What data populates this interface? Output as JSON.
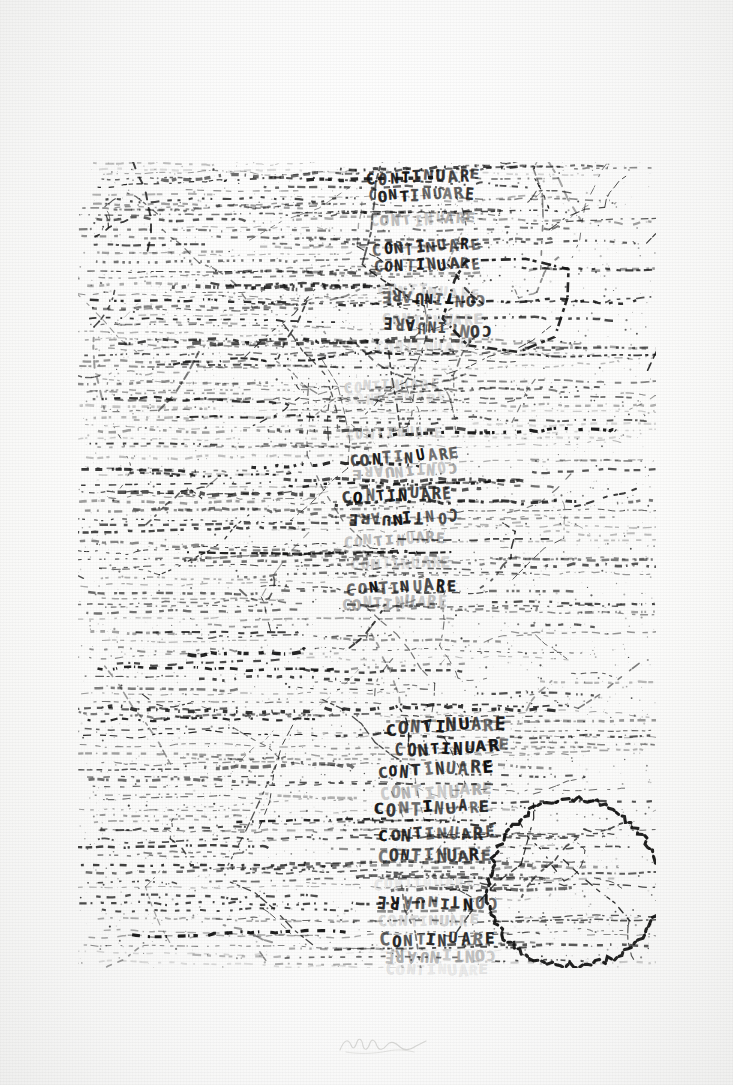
{
  "artwork": {
    "title": "CONTINUARE",
    "medium_appearance": "stamped ink print on paper, scanned",
    "paper_color": "#fdfdfd",
    "ink_color": "#101010",
    "stamped_word": "CONTINUARE",
    "plate": {
      "left": 78,
      "top": 162,
      "width": 578,
      "height": 806
    }
  },
  "text_blocks": [
    {
      "name": "upper-block",
      "rows": [
        {
          "text": "CONTINUARE",
          "x": 288,
          "y": 8,
          "size": 15,
          "rot": -2,
          "opacity": "solid",
          "flip": false,
          "scalex": 1.0
        },
        {
          "text": "CONTINUARE",
          "x": 290,
          "y": 26,
          "size": 15,
          "rot": -1,
          "opacity": "solid",
          "flip": false,
          "scalex": 1.0
        },
        {
          "text": "CONTINUARE",
          "x": 292,
          "y": 50,
          "size": 14,
          "rot": -3,
          "opacity": "faint",
          "flip": false,
          "scalex": 1.0
        },
        {
          "text": "CONTINUARE",
          "x": 294,
          "y": 78,
          "size": 15,
          "rot": -4,
          "opacity": "solid",
          "flip": false,
          "scalex": 1.0
        },
        {
          "text": "CONTINUARE",
          "x": 296,
          "y": 96,
          "size": 15,
          "rot": -2,
          "opacity": "solid",
          "flip": false,
          "scalex": 1.0
        },
        {
          "text": "CONTINUARE",
          "x": 300,
          "y": 122,
          "size": 14,
          "rot": 2,
          "opacity": "vfaint",
          "flip": false,
          "scalex": 1.0
        },
        {
          "text": "CONTINUARE",
          "x": 302,
          "y": 128,
          "size": 15,
          "rot": 3,
          "opacity": "solid",
          "flip": true,
          "scalex": 1.0
        },
        {
          "text": "CONTINUARE",
          "x": 304,
          "y": 150,
          "size": 14,
          "rot": -1,
          "opacity": "vfaint",
          "flip": false,
          "scalex": 1.0
        },
        {
          "text": "CONTINUARE",
          "x": 302,
          "y": 158,
          "size": 15,
          "rot": 4,
          "opacity": "solid",
          "flip": true,
          "scalex": 1.0
        },
        {
          "text": "CONTINUARE",
          "x": 298,
          "y": 178,
          "size": 13,
          "rot": -2,
          "opacity": "vvfaint",
          "flip": false,
          "scalex": 1.0
        }
      ]
    },
    {
      "name": "middle-block",
      "rows": [
        {
          "text": "CONTINUARE",
          "x": 266,
          "y": 216,
          "size": 13,
          "rot": -3,
          "opacity": "vfaint",
          "flip": false,
          "scalex": 1.0
        },
        {
          "text": "CONTINUARE",
          "x": 268,
          "y": 230,
          "size": 13,
          "rot": -2,
          "opacity": "vvfaint",
          "flip": false,
          "scalex": 1.0
        },
        {
          "text": "CONTINUARE",
          "x": 268,
          "y": 264,
          "size": 13,
          "rot": -2,
          "opacity": "vfaint",
          "flip": false,
          "scalex": 1.0
        },
        {
          "text": "CONTINUARE",
          "x": 272,
          "y": 288,
          "size": 15,
          "rot": -5,
          "opacity": "solid",
          "flip": false,
          "scalex": 1.0
        },
        {
          "text": "CONTINUARE",
          "x": 274,
          "y": 302,
          "size": 14,
          "rot": -3,
          "opacity": "faint",
          "flip": true,
          "scalex": 1.0
        },
        {
          "text": "CONTINUARE",
          "x": 264,
          "y": 326,
          "size": 15,
          "rot": -3,
          "opacity": "solid",
          "flip": false,
          "scalex": 1.0
        },
        {
          "text": "CONTINUARE",
          "x": 268,
          "y": 348,
          "size": 15,
          "rot": -2,
          "opacity": "solid",
          "flip": true,
          "scalex": 1.0
        },
        {
          "text": "CONTINUARE",
          "x": 266,
          "y": 370,
          "size": 14,
          "rot": -3,
          "opacity": "faint",
          "flip": false,
          "scalex": 1.0
        },
        {
          "text": "CONTINUARE",
          "x": 272,
          "y": 394,
          "size": 14,
          "rot": -3,
          "opacity": "vfaint",
          "flip": false,
          "scalex": 1.0
        },
        {
          "text": "CONTINUARE",
          "x": 268,
          "y": 418,
          "size": 15,
          "rot": -2,
          "opacity": "solid",
          "flip": false,
          "scalex": 1.0
        },
        {
          "text": "CONTINUARE",
          "x": 264,
          "y": 434,
          "size": 15,
          "rot": -1,
          "opacity": "faint",
          "flip": false,
          "scalex": 1.0
        }
      ]
    },
    {
      "name": "lower-block",
      "rows": [
        {
          "text": "CONTINUARE",
          "x": 308,
          "y": 556,
          "size": 17,
          "rot": -3,
          "opacity": "solid",
          "flip": false,
          "scalex": 1.0
        },
        {
          "text": "CONTINUARE",
          "x": 316,
          "y": 578,
          "size": 16,
          "rot": -2,
          "opacity": "solid",
          "flip": false,
          "scalex": 1.0
        },
        {
          "text": "CONTINUARE",
          "x": 300,
          "y": 600,
          "size": 16,
          "rot": -2,
          "opacity": "solid",
          "flip": false,
          "scalex": 1.0
        },
        {
          "text": "CONTINUARE",
          "x": 302,
          "y": 622,
          "size": 16,
          "rot": -2,
          "opacity": "faint",
          "flip": false,
          "scalex": 1.0
        },
        {
          "text": "CONTINUARE",
          "x": 296,
          "y": 638,
          "size": 16,
          "rot": -2,
          "opacity": "solid",
          "flip": false,
          "scalex": 1.0
        },
        {
          "text": "CONTINUARE",
          "x": 300,
          "y": 664,
          "size": 16,
          "rot": -1,
          "opacity": "solid",
          "flip": false,
          "scalex": 1.0
        },
        {
          "text": "CONTINUARE",
          "x": 300,
          "y": 686,
          "size": 16,
          "rot": -1,
          "opacity": "solid",
          "flip": false,
          "scalex": 1.0
        },
        {
          "text": "CONTINUARE",
          "x": 296,
          "y": 714,
          "size": 14,
          "rot": -1,
          "opacity": "vvfaint",
          "flip": false,
          "scalex": 1.0
        },
        {
          "text": "CONTINUARE",
          "x": 298,
          "y": 732,
          "size": 16,
          "rot": 1,
          "opacity": "solid",
          "flip": true,
          "scalex": 1.0
        },
        {
          "text": "CONTINUARE",
          "x": 300,
          "y": 752,
          "size": 14,
          "rot": -1,
          "opacity": "vfaint",
          "flip": false,
          "scalex": 1.0
        },
        {
          "text": "CONTINUARE",
          "x": 302,
          "y": 770,
          "size": 16,
          "rot": -1,
          "opacity": "solid",
          "flip": false,
          "scalex": 1.0
        },
        {
          "text": "CONTINUARE",
          "x": 306,
          "y": 786,
          "size": 15,
          "rot": 0,
          "opacity": "faint",
          "flip": true,
          "scalex": 1.0
        },
        {
          "text": "CONTINUARE",
          "x": 308,
          "y": 800,
          "size": 14,
          "rot": 0,
          "opacity": "vvfaint",
          "flip": false,
          "scalex": 1.0
        }
      ]
    }
  ],
  "shapes": [
    {
      "name": "circle-lower-right",
      "type": "circle",
      "cx": 496,
      "cy": 722,
      "r": 86
    },
    {
      "name": "polygon-upper-right",
      "type": "polygon",
      "cx": 430,
      "cy": 140,
      "rx": 70,
      "ry": 48
    }
  ],
  "signature": {
    "present": true,
    "legible": false,
    "note": "faint pencil signature in lower margin"
  }
}
